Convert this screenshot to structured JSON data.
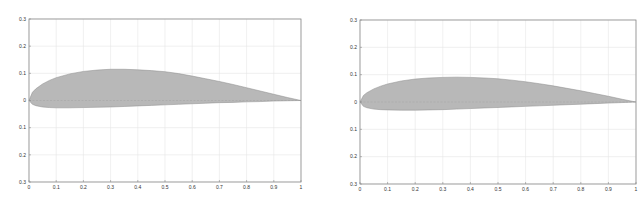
{
  "chart_data": [
    {
      "type": "area",
      "title": "",
      "xlabel": "",
      "ylabel": "",
      "xlim": [
        0,
        1
      ],
      "ylim": [
        -0.3,
        0.3
      ],
      "grid": true,
      "legend": null,
      "x_ticks": [
        "0",
        "0.1",
        "0.2",
        "0.3",
        "0.4",
        "0.5",
        "0.6",
        "0.7",
        "0.8",
        "0.9",
        "1"
      ],
      "y_ticks": [
        "0.3",
        "0.2",
        "0.1",
        "0",
        "-0.1",
        "-0.2",
        "-0.3"
      ],
      "y_tick_labels_as_shown": [
        "0.3",
        "0.2",
        "0.1",
        "0",
        "0.1",
        "0.2",
        "0.3"
      ],
      "fill_color": "#b8b8b8",
      "series": [
        {
          "name": "upper surface",
          "x": [
            0,
            0.0125,
            0.025,
            0.05,
            0.075,
            0.1,
            0.15,
            0.2,
            0.25,
            0.3,
            0.35,
            0.4,
            0.45,
            0.5,
            0.55,
            0.6,
            0.65,
            0.7,
            0.75,
            0.8,
            0.85,
            0.9,
            0.95,
            1.0
          ],
          "y": [
            0,
            0.03,
            0.043,
            0.061,
            0.074,
            0.084,
            0.098,
            0.107,
            0.112,
            0.115,
            0.115,
            0.113,
            0.11,
            0.106,
            0.099,
            0.09,
            0.08,
            0.07,
            0.059,
            0.047,
            0.035,
            0.023,
            0.011,
            0
          ]
        },
        {
          "name": "lower surface",
          "x": [
            0,
            0.0125,
            0.025,
            0.05,
            0.075,
            0.1,
            0.15,
            0.2,
            0.25,
            0.3,
            0.35,
            0.4,
            0.45,
            0.5,
            0.55,
            0.6,
            0.65,
            0.7,
            0.75,
            0.8,
            0.85,
            0.9,
            0.95,
            1.0
          ],
          "y": [
            0,
            -0.014,
            -0.019,
            -0.024,
            -0.026,
            -0.027,
            -0.027,
            -0.026,
            -0.025,
            -0.024,
            -0.022,
            -0.02,
            -0.018,
            -0.016,
            -0.014,
            -0.012,
            -0.01,
            -0.008,
            -0.007,
            -0.005,
            -0.004,
            -0.002,
            -0.001,
            0
          ]
        }
      ]
    },
    {
      "type": "area",
      "title": "",
      "xlabel": "",
      "ylabel": "",
      "xlim": [
        0,
        1
      ],
      "ylim": [
        -0.3,
        0.3
      ],
      "grid": true,
      "legend": null,
      "x_ticks": [
        "0",
        "0.1",
        "0.2",
        "0.3",
        "0.4",
        "0.5",
        "0.6",
        "0.7",
        "0.8",
        "0.9",
        "1"
      ],
      "y_ticks": [
        "0.3",
        "0.2",
        "0.1",
        "0",
        "-0.1",
        "-0.2",
        "-0.3"
      ],
      "y_tick_labels_as_shown": [
        "0.3",
        "0.2",
        "0.1",
        "0",
        "0.1",
        "0.2",
        "0.3"
      ],
      "fill_color": "#b8b8b8",
      "series": [
        {
          "name": "upper surface",
          "x": [
            0,
            0.0125,
            0.025,
            0.05,
            0.075,
            0.1,
            0.15,
            0.2,
            0.25,
            0.3,
            0.35,
            0.4,
            0.45,
            0.5,
            0.55,
            0.6,
            0.65,
            0.7,
            0.75,
            0.8,
            0.85,
            0.9,
            0.95,
            1.0
          ],
          "y": [
            0,
            0.024,
            0.034,
            0.048,
            0.058,
            0.066,
            0.077,
            0.084,
            0.088,
            0.09,
            0.091,
            0.09,
            0.088,
            0.085,
            0.08,
            0.074,
            0.067,
            0.059,
            0.05,
            0.041,
            0.031,
            0.021,
            0.01,
            0
          ]
        },
        {
          "name": "lower surface",
          "x": [
            0,
            0.0125,
            0.025,
            0.05,
            0.075,
            0.1,
            0.15,
            0.2,
            0.25,
            0.3,
            0.35,
            0.4,
            0.45,
            0.5,
            0.55,
            0.6,
            0.65,
            0.7,
            0.75,
            0.8,
            0.85,
            0.9,
            0.95,
            1.0
          ],
          "y": [
            0,
            -0.016,
            -0.021,
            -0.026,
            -0.028,
            -0.029,
            -0.03,
            -0.03,
            -0.029,
            -0.028,
            -0.026,
            -0.024,
            -0.022,
            -0.02,
            -0.018,
            -0.016,
            -0.014,
            -0.012,
            -0.01,
            -0.008,
            -0.006,
            -0.004,
            -0.002,
            0
          ]
        }
      ]
    }
  ]
}
